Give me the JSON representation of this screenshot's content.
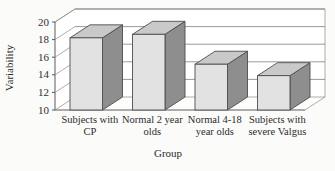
{
  "chart_data": {
    "type": "bar",
    "title": "",
    "subtitle": "",
    "xlabel": "Group",
    "ylabel": "Variability",
    "categories": [
      "Subjects with CP",
      "Normal 2 year olds",
      "Normal 4-18 year olds",
      "Subjects with severe Valgus"
    ],
    "category_lines": [
      [
        "Subjects with",
        "CP"
      ],
      [
        "Normal 2 year",
        "olds"
      ],
      [
        "Normal 4-18",
        "year olds"
      ],
      [
        "Subjects with",
        "severe Valgus"
      ]
    ],
    "values": [
      18.2,
      18.6,
      15.2,
      13.9
    ],
    "ylim": [
      10,
      20
    ],
    "yticks": [
      10,
      12,
      14,
      16,
      18,
      20
    ],
    "ytick_labels": [
      "10",
      "12",
      "14",
      "16",
      "18",
      "20"
    ],
    "grid": true,
    "legend": "none",
    "style": "3d-column",
    "colors": {
      "bar_front": "#e2e2e2",
      "bar_top": "#c9c9c9",
      "bar_side": "#8e8e8e",
      "bar_outline": "#4d4d4d",
      "gridline": "#6f6f6f",
      "axis": "#4a4a4a",
      "background": "#fbfbfa",
      "wall": "#ffffff",
      "text": "#2b2b2b"
    }
  }
}
